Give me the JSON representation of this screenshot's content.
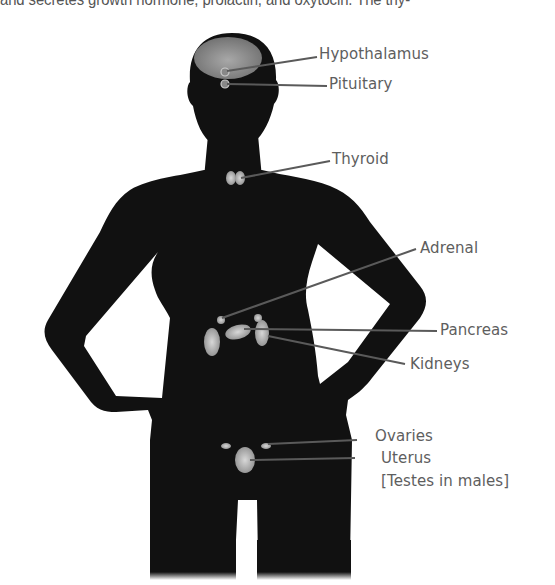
{
  "document": {
    "body_text_fragment": "and secretes growth hormone, prolactin, and oxytocin. The thy-"
  },
  "figure": {
    "type": "anatomical-diagram",
    "colors": {
      "silhouette": "#111111",
      "gland": "#bdbdbd",
      "leader_line": "#5a5a5a",
      "label_text": "#5e5e5e",
      "background": "#ffffff"
    },
    "labels": [
      {
        "id": "hypothalamus",
        "text": "Hypothalamus"
      },
      {
        "id": "pituitary",
        "text": "Pituitary"
      },
      {
        "id": "thyroid",
        "text": "Thyroid"
      },
      {
        "id": "adrenal",
        "text": "Adrenal"
      },
      {
        "id": "pancreas",
        "text": "Pancreas"
      },
      {
        "id": "kidneys",
        "text": "Kidneys"
      },
      {
        "id": "ovaries",
        "text": "Ovaries"
      },
      {
        "id": "uterus",
        "text": "Uterus"
      },
      {
        "id": "testes-note",
        "text": "[Testes in males]"
      }
    ]
  }
}
